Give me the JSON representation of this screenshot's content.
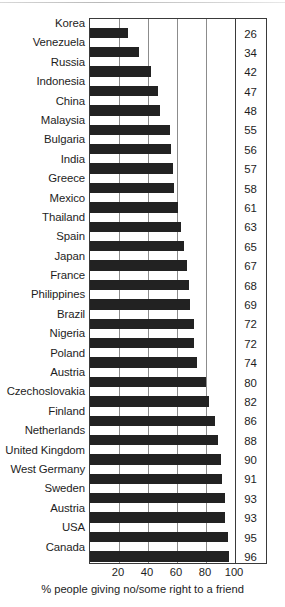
{
  "chart_data": {
    "type": "bar",
    "orientation": "horizontal",
    "title": "",
    "xlabel": "% people giving no/some right to a friend",
    "ylabel": "",
    "xlim": [
      0,
      100
    ],
    "xticks": [
      20,
      40,
      60,
      80,
      100
    ],
    "xtick_labels": [
      "20",
      "40",
      "60",
      "80",
      "100"
    ],
    "grid": true,
    "grid_axis": "x",
    "legend": false,
    "value_labels_shown": true,
    "bar_color": "#222222",
    "grid_color": "#8c8c8c",
    "frame_color": "#3a3a3a",
    "categories": [
      "Korea",
      "Venezuela",
      "Russia",
      "Indonesia",
      "China",
      "Malaysia",
      "Bulgaria",
      "India",
      "Greece",
      "Mexico",
      "Thailand",
      "Spain",
      "Japan",
      "France",
      "Philippines",
      "Brazil",
      "Nigeria",
      "Poland",
      "Austria",
      "Czechoslovakia",
      "Finland",
      "Netherlands",
      "United Kingdom",
      "West Germany",
      "Sweden",
      "Austria",
      "USA",
      "Canada"
    ],
    "values": [
      26,
      34,
      42,
      47,
      48,
      55,
      56,
      57,
      58,
      61,
      63,
      65,
      67,
      68,
      69,
      72,
      72,
      74,
      80,
      82,
      86,
      88,
      90,
      91,
      93,
      93,
      95,
      96
    ],
    "value_label_texts": [
      "26",
      "34",
      "42",
      "47",
      "48",
      "55",
      "56",
      "57",
      "58",
      "61",
      "63",
      "65",
      "67",
      "68",
      "69",
      "72",
      "72",
      "74",
      "80",
      "82",
      "86",
      "88",
      "90",
      "91",
      "93",
      "93",
      "95",
      "96"
    ]
  }
}
